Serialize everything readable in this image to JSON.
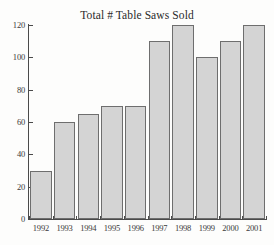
{
  "chart_data": {
    "type": "bar",
    "title": "Total # Table Saws Sold",
    "xlabel": "",
    "ylabel": "",
    "categories": [
      "1992",
      "1993",
      "1994",
      "1995",
      "1996",
      "1997",
      "1998",
      "1999",
      "2000",
      "2001"
    ],
    "values": [
      30,
      60,
      65,
      70,
      70,
      110,
      120,
      100,
      110,
      120
    ],
    "ylim": [
      0,
      120
    ],
    "yticks": [
      0,
      20,
      40,
      60,
      80,
      100,
      120
    ],
    "ytick_labels": [
      "0",
      "20",
      "40",
      "60",
      "80",
      "100",
      "120"
    ],
    "grid": false,
    "legend": null,
    "bar_color": "#d4d4d4",
    "bar_edge_color": "#6e6e6e",
    "axis_color": "#4a4a4a",
    "background_color": "#fdfdfc"
  }
}
